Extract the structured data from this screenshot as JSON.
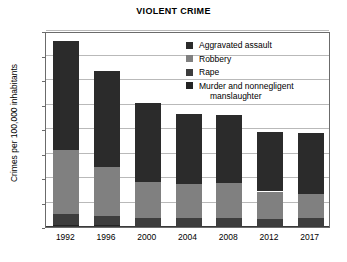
{
  "chart_data": {
    "type": "bar",
    "title": "VIOLENT CRIME",
    "xlabel": "",
    "ylabel": "Crimes per 100,000 inhabitants",
    "categories": [
      "1992",
      "1996",
      "2000",
      "2004",
      "2008",
      "2012",
      "2017"
    ],
    "ylim": [
      0,
      800
    ],
    "yticks": [
      0,
      100,
      200,
      300,
      400,
      500,
      600,
      700,
      800
    ],
    "ytick_labels": [
      "0",
      "100",
      "200",
      "300",
      "400",
      "500",
      "600",
      "700",
      "800"
    ],
    "grid": true,
    "stacked": true,
    "legend_position": "inside-top-right",
    "series": [
      {
        "name": "Aggravated assault",
        "color": "#2b2b2b",
        "values": [
          442,
          391,
          324,
          289,
          277,
          243,
          249
        ]
      },
      {
        "name": "Robbery",
        "color": "#808080",
        "values": [
          264,
          201,
          145,
          137,
          145,
          113,
          98
        ]
      },
      {
        "name": "Rape",
        "color": "#3d3d3d",
        "values": [
          43,
          36,
          32,
          32,
          30,
          27,
          31
        ]
      },
      {
        "name": "Murder and nonnegligent manslaughter",
        "color": "#242424",
        "values": [
          9,
          8,
          6,
          5,
          5,
          5,
          5
        ]
      }
    ],
    "totals": [
      758,
      636,
      507,
      463,
      457,
      388,
      383
    ]
  },
  "legend": {
    "items": [
      {
        "label": "Aggravated assault",
        "label2": ""
      },
      {
        "label": "Robbery",
        "label2": ""
      },
      {
        "label": "Rape",
        "label2": ""
      },
      {
        "label": "Murder and nonnegligent",
        "label2": "manslaughter"
      }
    ]
  }
}
